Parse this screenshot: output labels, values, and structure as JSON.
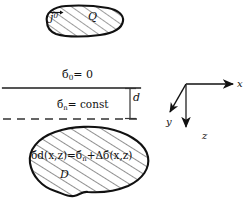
{
  "figure": {
    "background_color": "#ffffff",
    "ink_color": "#111111",
    "line_color": "#555555",
    "labels": {
      "source_current": "j",
      "source_current_superscript": "0",
      "source_charge": "Q",
      "sigma_symbol": "б",
      "surface_conductivity": "б",
      "surface_conductivity_sub": "0",
      "surface_equation_rhs": "= 0",
      "normal_conductivity": "б",
      "normal_conductivity_sub": "n",
      "normal_equation_rhs": "= const",
      "depth_label": "d",
      "axis_x": "x",
      "axis_y": "y",
      "axis_z": "z",
      "domain_label": "D",
      "domain_equation": {
        "lhs_symbol": "б",
        "lhs_sub": "d",
        "lhs_args": "(x,z)",
        "equals": "=",
        "rhs_first_symbol": "б",
        "rhs_first_sub": "n",
        "plus": "+",
        "delta": "Δ",
        "rhs_second_symbol": "б",
        "rhs_second_args": "(x,z)"
      }
    },
    "shapes": {
      "upper_blob_name": "source-region-blob",
      "lower_blob_name": "anomalous-domain-blob",
      "solid_line_name": "ground-surface-line",
      "dashed_line_name": "layer-boundary-line"
    }
  }
}
